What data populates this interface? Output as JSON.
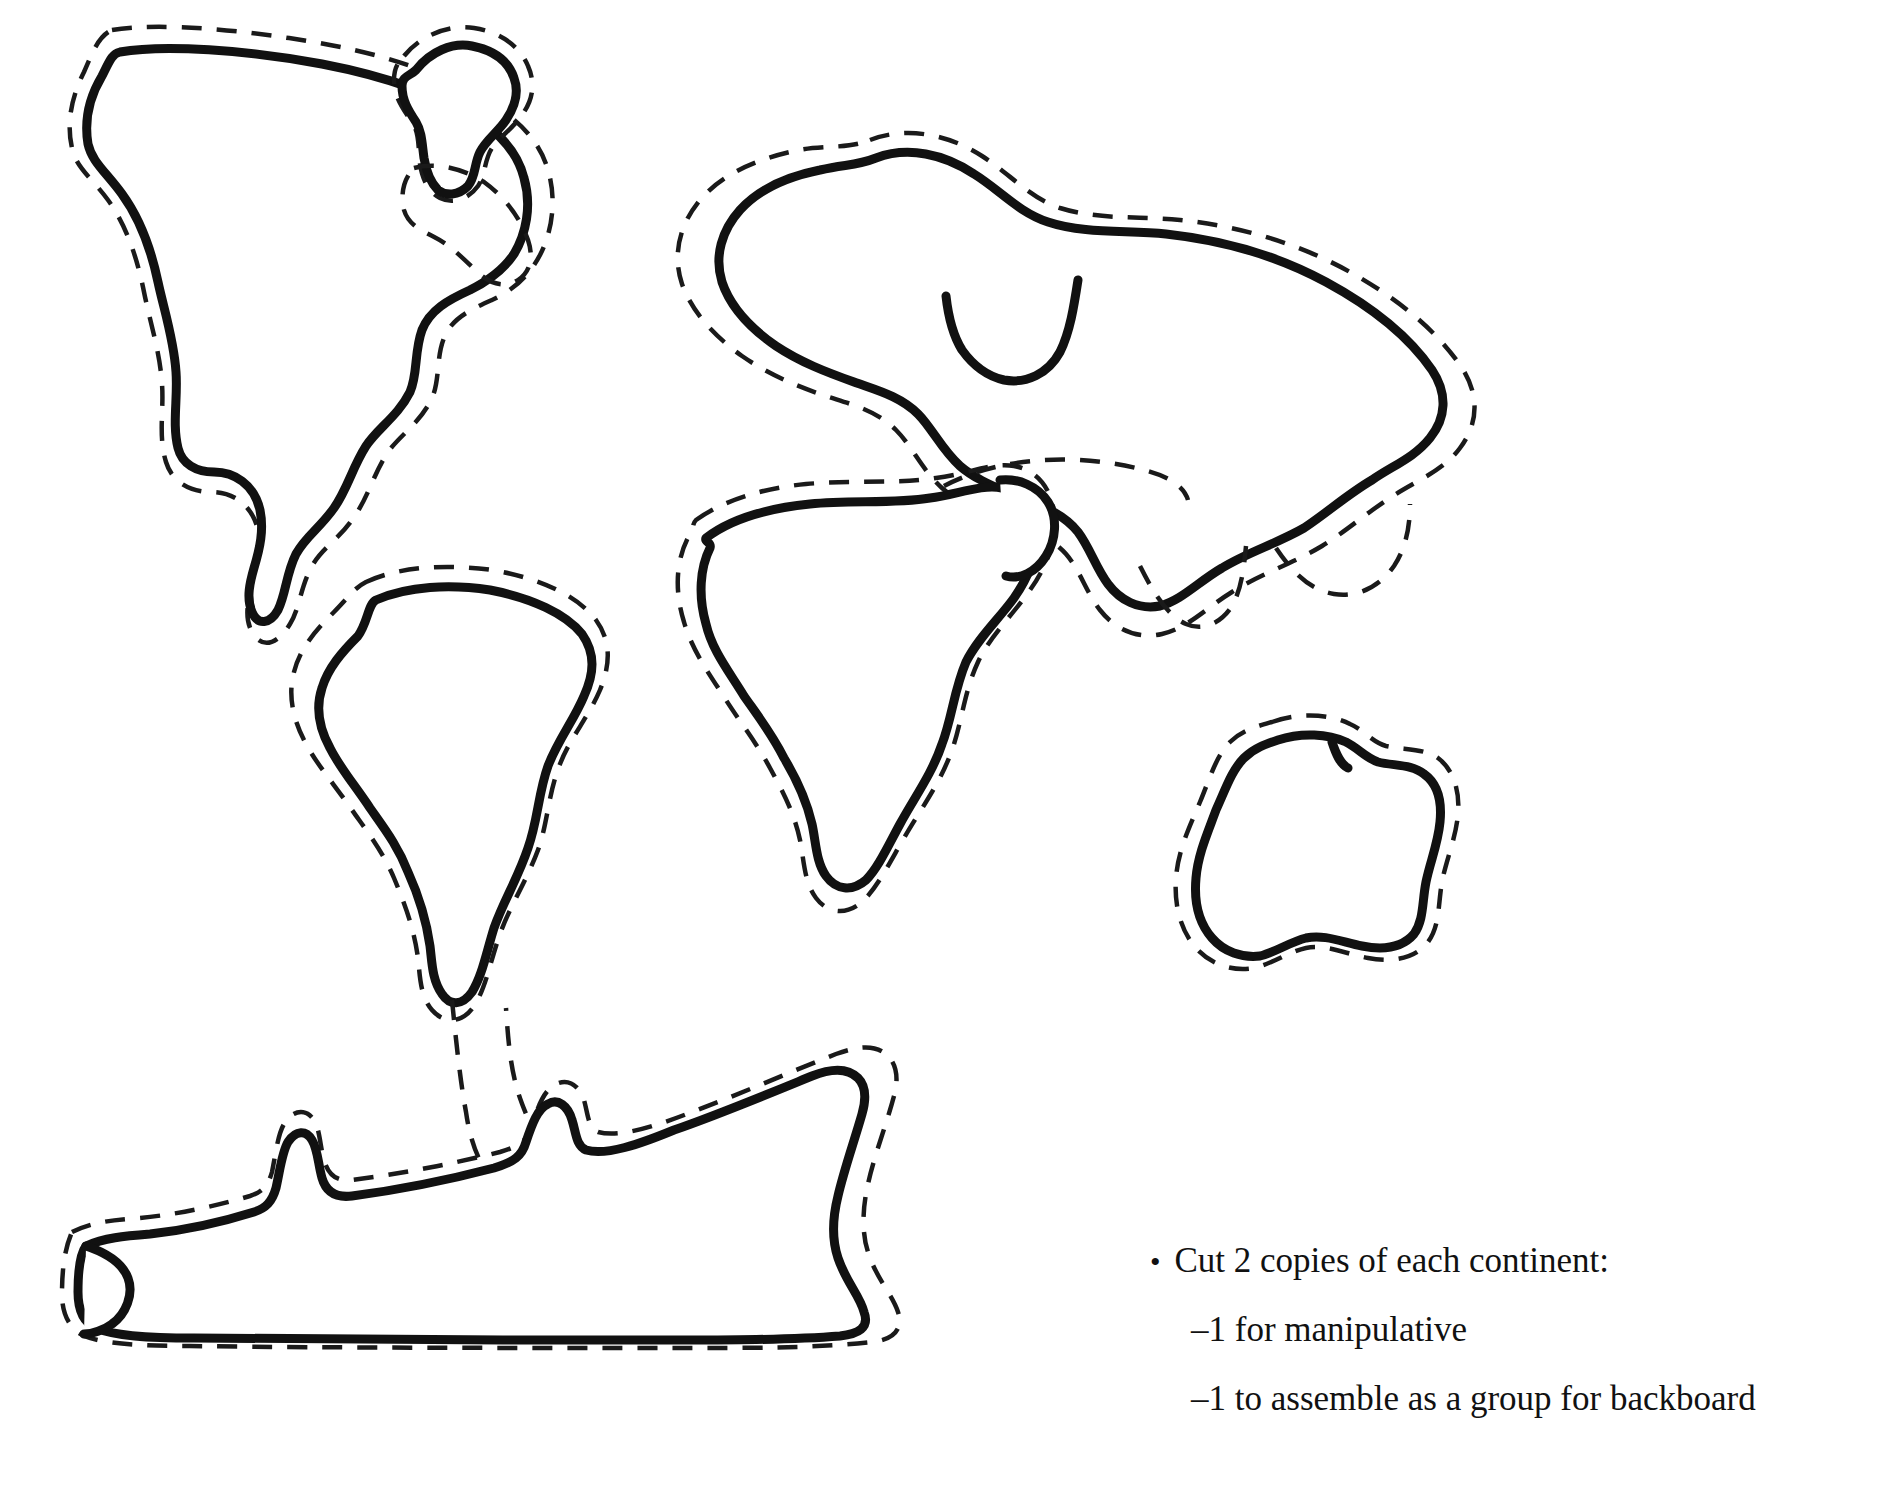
{
  "page": {
    "background_color": "#ffffff",
    "ink_color": "#111111",
    "width": 1881,
    "height": 1503
  },
  "instructions": {
    "bullet_glyph": "•",
    "bullet_line": "Cut 2 copies of each continent:",
    "sub_lines": [
      "–1 for manipulative",
      "–1 to assemble as a group for backboard"
    ]
  },
  "legend": {
    "solid_line_meaning": "continent coastline outline",
    "dashed_line_meaning": "cutting guide offset outside the coastline"
  },
  "shapes": [
    {
      "name": "north-america",
      "label": "North America",
      "bbox": [
        55,
        25,
        560,
        600
      ],
      "has_cut_line": true
    },
    {
      "name": "greenland",
      "label": "Greenland",
      "bbox": [
        400,
        25,
        530,
        240
      ],
      "has_cut_line": true
    },
    {
      "name": "south-america",
      "label": "South America",
      "bbox": [
        280,
        555,
        600,
        1015
      ],
      "has_cut_line": true
    },
    {
      "name": "eurasia",
      "label": "Eurasia",
      "bbox": [
        665,
        130,
        1485,
        620
      ],
      "has_cut_line": true
    },
    {
      "name": "africa",
      "label": "Africa",
      "bbox": [
        670,
        455,
        1060,
        910
      ],
      "has_cut_line": true
    },
    {
      "name": "australia",
      "label": "Australia",
      "bbox": [
        1175,
        715,
        1455,
        985
      ],
      "has_cut_line": true
    },
    {
      "name": "antarctica",
      "label": "Antarctica",
      "bbox": [
        65,
        1035,
        900,
        1215
      ],
      "has_cut_line": true
    }
  ]
}
